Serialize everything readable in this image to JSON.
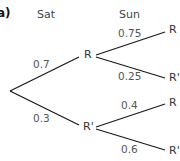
{
  "part_label": "a)",
  "headers": {
    "first": "Sat",
    "second": "Sun"
  },
  "tree": {
    "first_level": [
      {
        "node": "R",
        "prob": "0.7",
        "children": [
          {
            "node": "R",
            "prob": "0.75"
          },
          {
            "node": "R'",
            "prob": "0.25"
          }
        ]
      },
      {
        "node": "R'",
        "prob": "0.3",
        "children": [
          {
            "node": "R",
            "prob": "0.4"
          },
          {
            "node": "R'",
            "prob": "0.6"
          }
        ]
      }
    ]
  },
  "colors": {
    "line": "#1a1a1a",
    "text": "#3a3a3a"
  }
}
